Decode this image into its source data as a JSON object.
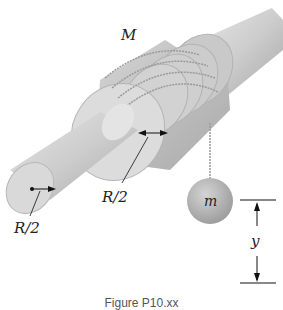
{
  "figure": {
    "labels": {
      "spool_mass": "M",
      "hanging_mass": "m",
      "shaft_radius": "R/2",
      "spool_step": "R/2",
      "drop_height": "y"
    },
    "caption": "Figure P10.xx",
    "colors": {
      "shaft": "#cfcfcf",
      "shaft_end": "#dadada",
      "spool": "#c4c4c4",
      "spool_face": "#d8d8d8",
      "string": "#9a9a9a",
      "ball": "#b0b0b0",
      "ink": "#222222"
    }
  }
}
